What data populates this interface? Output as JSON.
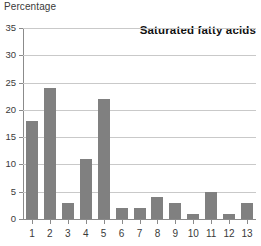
{
  "chart_data": {
    "type": "bar",
    "title": "Saturated fatty acids",
    "ylabel": "Percentage",
    "xlabel": "",
    "categories": [
      "1",
      "2",
      "3",
      "4",
      "5",
      "6",
      "7",
      "8",
      "9",
      "10",
      "11",
      "12",
      "13"
    ],
    "values": [
      18,
      24,
      3,
      11,
      22,
      2,
      2,
      4,
      3,
      1,
      5,
      1,
      3
    ],
    "ylim": [
      0,
      35
    ],
    "yticks": [
      0,
      5,
      10,
      15,
      20,
      25,
      30,
      35
    ],
    "ytick_labels": [
      "0",
      "5",
      "10",
      "15",
      "20",
      "25",
      "30",
      "35"
    ],
    "grid": true,
    "legend": false,
    "bar_color": "#808080",
    "gridline_color": "#c9c9c9",
    "axis_color": "#8b8b8b",
    "background_color": "#ffffff"
  }
}
